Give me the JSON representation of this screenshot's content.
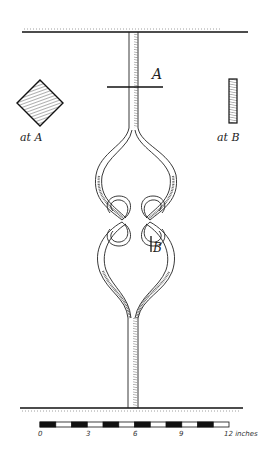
{
  "diagram": {
    "section_marks": {
      "a": "A",
      "b": "B"
    },
    "section_details": {
      "at_a": {
        "caption": "at A",
        "shape": "diamond (square bar set on edge)"
      },
      "at_b": {
        "caption": "at B",
        "shape": "flat bar (narrow rectangle)"
      }
    },
    "scale_bar": {
      "ticks": [
        "0",
        "3",
        "6",
        "9"
      ],
      "end_label": "12 inches",
      "segments": 12
    },
    "colors": {
      "ink": "#222222",
      "paper": "#ffffff"
    }
  }
}
